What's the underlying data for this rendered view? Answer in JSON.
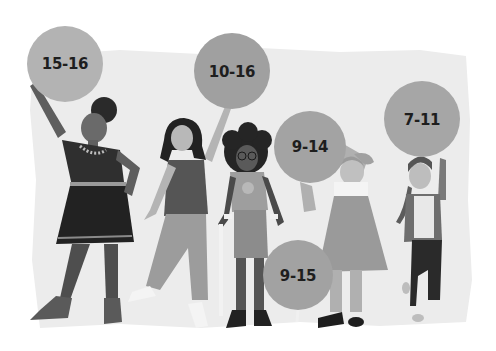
{
  "illustration": {
    "description": "Five girls of different ages standing together, each holding a balloon labelled with an age range",
    "background_color": "#ececec",
    "balloon_color": "#a9a9a9",
    "balloons": [
      {
        "label": "15-16"
      },
      {
        "label": "10-16"
      },
      {
        "label": "9-14"
      },
      {
        "label": "7-11"
      },
      {
        "label": "9-15"
      }
    ]
  }
}
